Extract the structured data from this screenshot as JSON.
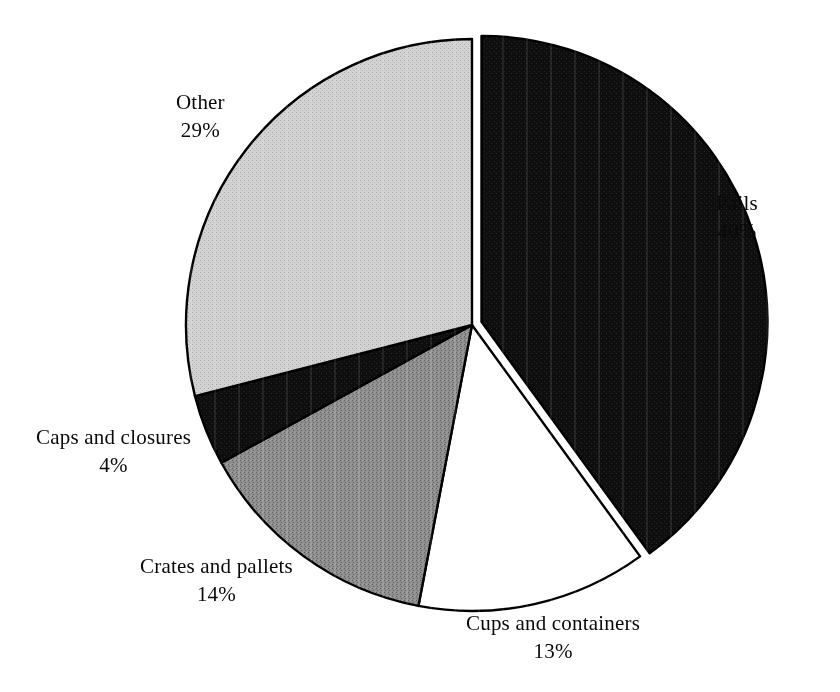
{
  "chart_data": {
    "type": "pie",
    "title": "",
    "subtitle": "",
    "xlabel": "",
    "ylabel": "",
    "legend_position": "none",
    "grid": false,
    "label_format": "name_above_percent_below",
    "start_angle_deg": 0,
    "direction": "clockwise",
    "categories": [
      "Pails",
      "Cups and containers",
      "Crates and pallets",
      "Caps and closures",
      "Other"
    ],
    "values": [
      40,
      13,
      14,
      4,
      29
    ],
    "units": "percent",
    "slices": [
      {
        "name": "Pails",
        "value": 40,
        "value_label": "40%",
        "color": "#111111",
        "fill_style": "solid-black",
        "exploded": true
      },
      {
        "name": "Cups and containers",
        "value": 13,
        "value_label": "13%",
        "color": "#ffffff",
        "fill_style": "solid-white",
        "exploded": false
      },
      {
        "name": "Crates and pallets",
        "value": 14,
        "value_label": "14%",
        "color": "#8a8a8a",
        "fill_style": "medium-gray",
        "exploded": false
      },
      {
        "name": "Caps and closures",
        "value": 4,
        "value_label": "4%",
        "color": "#151515",
        "fill_style": "solid-black",
        "exploded": false
      },
      {
        "name": "Other",
        "value": 29,
        "value_label": "29%",
        "color": "#cfcfcf",
        "fill_style": "light-gray",
        "exploded": false
      }
    ]
  },
  "labels": {
    "pails": {
      "name": "Pails",
      "value": "40%"
    },
    "cups": {
      "name": "Cups and containers",
      "value": "13%"
    },
    "crates": {
      "name": "Crates and pallets",
      "value": "14%"
    },
    "caps": {
      "name": "Caps and closures",
      "value": "4%"
    },
    "other": {
      "name": "Other",
      "value": "29%"
    }
  },
  "style": {
    "background": "#ffffff",
    "outline": "#000000",
    "text": "#0a0a0a"
  }
}
